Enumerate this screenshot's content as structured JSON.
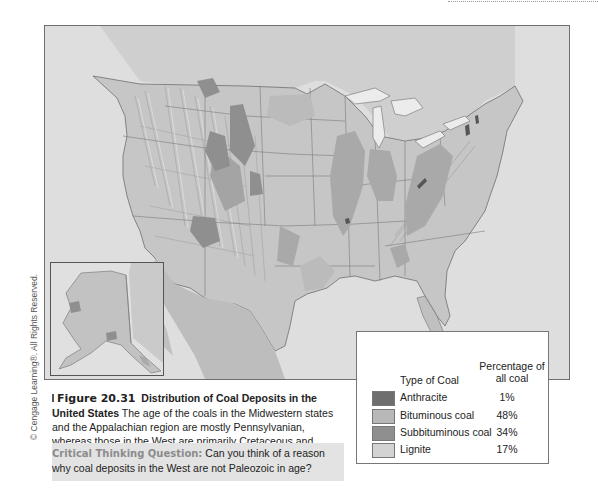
{
  "figure": {
    "number": "Figure 20.31",
    "title": "Distribution of Coal Deposits in the United States",
    "description": "The age of the coals in the Midwestern states and the Appalachian region are mostly Pennsylvanian, whereas those in the West are primarily Cretaceous and Cenozoic."
  },
  "critical_thinking": {
    "label": "Critical Thinking Question:",
    "text": "Can you think of a reason why coal deposits in the West are not Paleozoic in age?"
  },
  "copyright": "© Cengage Learning®. All Rights Reserved.",
  "legend": {
    "header_type": "Type of Coal",
    "header_pct_line1": "Percentage of",
    "header_pct_line2": "all coal",
    "items": [
      {
        "label": "Anthracite",
        "percent": "1%",
        "color": "#6e6e6e"
      },
      {
        "label": "Bituminous coal",
        "percent": "48%",
        "color": "#b8b8b8"
      },
      {
        "label": "Subbituminous coal",
        "percent": "34%",
        "color": "#8f8f8f"
      },
      {
        "label": "Lignite",
        "percent": "17%",
        "color": "#d3d3d3"
      }
    ]
  },
  "map": {
    "region": "United States",
    "inset": "Alaska",
    "colors": {
      "land": "#c4c4c4",
      "water": "#e2e2e2",
      "lakes": "#ececec",
      "border": "#6f6f6f",
      "mountain_shade": "#b0b0b0"
    }
  }
}
